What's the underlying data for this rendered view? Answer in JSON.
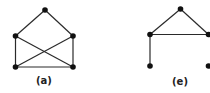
{
  "colors": {
    "edge": "#2a2a2a",
    "node": "#111111",
    "label": "#222222"
  },
  "graphs": [
    {
      "label": "(a)",
      "label_pos": [
        44,
        84
      ],
      "nodes": [
        {
          "id": "top",
          "x": 45,
          "y": 10
        },
        {
          "id": "ul",
          "x": 15.5,
          "y": 36
        },
        {
          "id": "ur",
          "x": 73,
          "y": 36
        },
        {
          "id": "ll",
          "x": 15.5,
          "y": 67
        },
        {
          "id": "lr",
          "x": 73,
          "y": 67
        }
      ],
      "edges": [
        [
          "top",
          "ul"
        ],
        [
          "top",
          "ur"
        ],
        [
          "ul",
          "ll"
        ],
        [
          "ur",
          "lr"
        ],
        [
          "ll",
          "lr"
        ],
        [
          "ul",
          "lr"
        ],
        [
          "ur",
          "ll"
        ]
      ]
    },
    {
      "label": "(e)",
      "label_pos": [
        180,
        85
      ],
      "nodes": [
        {
          "id": "top",
          "x": 180.5,
          "y": 9
        },
        {
          "id": "ul",
          "x": 150,
          "y": 34.5
        },
        {
          "id": "ur",
          "x": 208.5,
          "y": 34.5
        },
        {
          "id": "ll",
          "x": 150,
          "y": 66
        },
        {
          "id": "lr",
          "x": 208.5,
          "y": 66
        }
      ],
      "edges": [
        [
          "top",
          "ul"
        ],
        [
          "top",
          "ur"
        ],
        [
          "ul",
          "ur"
        ],
        [
          "ul",
          "ll"
        ]
      ]
    }
  ]
}
